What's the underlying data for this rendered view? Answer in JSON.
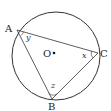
{
  "diagram": {
    "colors": {
      "stroke": "#333333",
      "background": "#ffffff"
    },
    "circle": {
      "center_label": "O",
      "cx": 56,
      "cy": 56,
      "r": 44
    },
    "points": [
      {
        "label": "A",
        "x": 17,
        "y": 30
      },
      {
        "label": "B",
        "x": 52,
        "y": 99
      },
      {
        "label": "C",
        "x": 98,
        "y": 53
      }
    ],
    "angles": [
      {
        "vertex": "A",
        "variable": "y"
      },
      {
        "vertex": "C",
        "variable": "x"
      },
      {
        "vertex": "B",
        "variable": "z"
      }
    ]
  }
}
